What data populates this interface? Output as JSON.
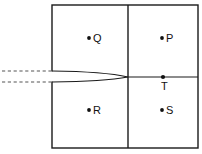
{
  "figure": {
    "type": "geometry-diagram",
    "background_color": "#ffffff",
    "stroke_color": "#1a1a1a",
    "dash_color": "#555555",
    "label_color": "#111111",
    "width": 202,
    "height": 154
  },
  "frame": {
    "name": "outer-rectangle",
    "x": 52,
    "y": 5,
    "width": 146,
    "height": 143
  },
  "divider_vertical": {
    "name": "vertical-divider",
    "x": 128,
    "y_top": 5,
    "y_bottom": 148
  },
  "divider_horizontal": {
    "name": "horizontal-axis",
    "y": 77,
    "x_start": 128,
    "x_end": 198
  },
  "wedge": {
    "name": "converging-wedge",
    "x_start": 52,
    "x_tip": 128,
    "y_upper": 71,
    "y_lower": 82,
    "y_tip": 77
  },
  "rays": [
    {
      "name": "upper-dashed-ray",
      "y": 71,
      "x_start": 2,
      "x_end": 52,
      "style": "dashed"
    },
    {
      "name": "lower-dashed-ray",
      "y": 82,
      "x_start": 2,
      "x_end": 52,
      "style": "dashed"
    }
  ],
  "points": [
    {
      "id": "Q",
      "label": "Q",
      "dot_x": 89,
      "dot_y": 38,
      "label_x": 93,
      "label_y": 42,
      "quadrant": "upper-left"
    },
    {
      "id": "P",
      "label": "P",
      "dot_x": 162,
      "dot_y": 38,
      "label_x": 166,
      "label_y": 42,
      "quadrant": "upper-right"
    },
    {
      "id": "R",
      "label": "R",
      "dot_x": 89,
      "dot_y": 110,
      "label_x": 93,
      "label_y": 114,
      "quadrant": "lower-left"
    },
    {
      "id": "S",
      "label": "S",
      "dot_x": 162,
      "dot_y": 110,
      "label_x": 166,
      "label_y": 114,
      "quadrant": "lower-right"
    },
    {
      "id": "T",
      "label": "T",
      "dot_x": 163,
      "dot_y": 77,
      "label_x": 161,
      "label_y": 90,
      "quadrant": "on-axis"
    }
  ]
}
